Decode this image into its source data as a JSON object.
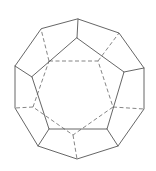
{
  "diagram": {
    "title": "",
    "shape": "dodecahedron",
    "view": "face-on wireframe with hidden edges dashed",
    "colors": {
      "background": "#ffffff",
      "visible_edge": "#555555",
      "hidden_edge": "#666666"
    },
    "outer_decagon": [
      [
        78,
        19
      ],
      [
        119,
        33
      ],
      [
        144,
        68
      ],
      [
        144,
        109
      ],
      [
        118,
        146
      ],
      [
        77,
        159
      ],
      [
        38,
        146
      ],
      [
        15,
        108
      ],
      [
        15,
        66
      ],
      [
        41,
        29
      ]
    ],
    "front_pentagon": [
      [
        77,
        38
      ],
      [
        124,
        72
      ],
      [
        107,
        129
      ],
      [
        49,
        129
      ],
      [
        32,
        77
      ]
    ],
    "front_spokes": [
      [
        [
          77,
          38
        ],
        [
          78,
          19
        ]
      ],
      [
        [
          124,
          72
        ],
        [
          144,
          68
        ]
      ],
      [
        [
          107,
          129
        ],
        [
          118,
          146
        ]
      ],
      [
        [
          49,
          129
        ],
        [
          38,
          146
        ]
      ],
      [
        [
          32,
          77
        ],
        [
          15,
          66
        ]
      ]
    ],
    "outer_to_front": [],
    "back_pentagon": [
      [
        49,
        61
      ],
      [
        98,
        61
      ],
      [
        113,
        107
      ],
      [
        73,
        135
      ],
      [
        33,
        107
      ]
    ],
    "back_spokes": [
      [
        [
          49,
          61
        ],
        [
          41,
          29
        ]
      ],
      [
        [
          98,
          61
        ],
        [
          119,
          33
        ]
      ],
      [
        [
          113,
          107
        ],
        [
          144,
          109
        ]
      ],
      [
        [
          73,
          135
        ],
        [
          77,
          159
        ]
      ],
      [
        [
          33,
          107
        ],
        [
          15,
          108
        ]
      ]
    ]
  }
}
